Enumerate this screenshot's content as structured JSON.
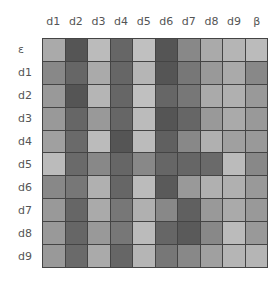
{
  "chart_data": {
    "type": "heatmap",
    "title": "",
    "xlabel": "",
    "ylabel": "",
    "x_labels": [
      "d1",
      "d2",
      "d3",
      "d4",
      "d5",
      "d6",
      "d7",
      "d8",
      "d9",
      "β"
    ],
    "y_labels": [
      "ε",
      "d1",
      "d2",
      "d3",
      "d4",
      "d5",
      "d6",
      "d7",
      "d8",
      "d9"
    ],
    "colormap": "grayscale (light = low, dark = high)",
    "legend": "none",
    "values": [
      [
        "#aaaaaa",
        "#555555",
        "#bbbbbb",
        "#666666",
        "#c0c0c0",
        "#555555",
        "#888888",
        "#aaaaaa",
        "#b5b5b5",
        "#bbbbbb"
      ],
      [
        "#888888",
        "#666666",
        "#aaaaaa",
        "#666666",
        "#b5b5b5",
        "#555555",
        "#777777",
        "#999999",
        "#aaaaaa",
        "#888888"
      ],
      [
        "#999999",
        "#555555",
        "#b5b5b5",
        "#666666",
        "#c0c0c0",
        "#666666",
        "#777777",
        "#aaaaaa",
        "#b0b0b0",
        "#999999"
      ],
      [
        "#999999",
        "#666666",
        "#999999",
        "#666666",
        "#bbbbbb",
        "#555555",
        "#666666",
        "#999999",
        "#aaaaaa",
        "#999999"
      ],
      [
        "#a0a0a0",
        "#6a6a6a",
        "#bbbbbb",
        "#555555",
        "#bbbbbb",
        "#606060",
        "#888888",
        "#b0b0b0",
        "#a0a0a0",
        "#999999"
      ],
      [
        "#bbbbbb",
        "#6a6a6a",
        "#888888",
        "#666666",
        "#888888",
        "#666666",
        "#666666",
        "#6a6a6a",
        "#bbbbbb",
        "#888888"
      ],
      [
        "#888888",
        "#777777",
        "#b0b0b0",
        "#666666",
        "#bbbbbb",
        "#5a5a5a",
        "#999999",
        "#b0b0b0",
        "#b0b0b0",
        "#999999"
      ],
      [
        "#999999",
        "#666666",
        "#aaaaaa",
        "#777777",
        "#b0b0b0",
        "#888888",
        "#606060",
        "#999999",
        "#aaaaaa",
        "#999999"
      ],
      [
        "#999999",
        "#666666",
        "#999999",
        "#777777",
        "#bbbbbb",
        "#666666",
        "#5a5a5a",
        "#888888",
        "#bbbbbb",
        "#999999"
      ],
      [
        "#999999",
        "#6a6a6a",
        "#aaaaaa",
        "#666666",
        "#b5b5b5",
        "#777777",
        "#888888",
        "#a0a0a0",
        "#b5b5b5",
        "#b5b5b5"
      ]
    ],
    "intensity": [
      [
        0.33,
        0.67,
        0.27,
        0.6,
        0.25,
        0.67,
        0.47,
        0.33,
        0.29,
        0.27
      ],
      [
        0.47,
        0.6,
        0.33,
        0.6,
        0.29,
        0.67,
        0.53,
        0.4,
        0.33,
        0.47
      ],
      [
        0.4,
        0.67,
        0.29,
        0.6,
        0.25,
        0.6,
        0.53,
        0.33,
        0.31,
        0.4
      ],
      [
        0.4,
        0.6,
        0.4,
        0.6,
        0.27,
        0.67,
        0.6,
        0.4,
        0.33,
        0.4
      ],
      [
        0.37,
        0.58,
        0.27,
        0.67,
        0.27,
        0.62,
        0.47,
        0.31,
        0.37,
        0.4
      ],
      [
        0.27,
        0.58,
        0.47,
        0.6,
        0.47,
        0.6,
        0.6,
        0.58,
        0.27,
        0.47
      ],
      [
        0.47,
        0.53,
        0.31,
        0.6,
        0.27,
        0.65,
        0.4,
        0.31,
        0.31,
        0.4
      ],
      [
        0.4,
        0.6,
        0.33,
        0.53,
        0.31,
        0.47,
        0.62,
        0.4,
        0.33,
        0.4
      ],
      [
        0.4,
        0.6,
        0.4,
        0.53,
        0.27,
        0.6,
        0.65,
        0.47,
        0.27,
        0.4
      ],
      [
        0.4,
        0.58,
        0.33,
        0.6,
        0.29,
        0.53,
        0.47,
        0.37,
        0.29,
        0.29
      ]
    ],
    "grid_lines": true,
    "grid_line_color": "#444444"
  }
}
